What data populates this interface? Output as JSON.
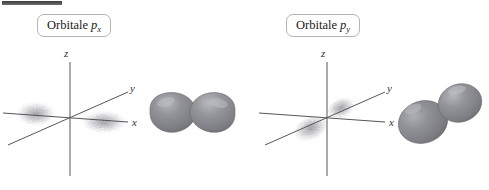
{
  "figure": {
    "type": "atomic-orbital-diagram",
    "background_color": "#ffffff",
    "top_rule_color": "#4a4a4a",
    "axis_color": "#55565a",
    "lobe_color": "#82838a",
    "lobe_highlight_color": "#b9bac0",
    "cloud_color": "#9a9aa0"
  },
  "panels": [
    {
      "id": "px",
      "label": {
        "prefix": "Orbitale ",
        "symbol": "p",
        "subscript": "x"
      },
      "axes": {
        "z": "z",
        "y": "y",
        "x": "x"
      },
      "cloud_axis": "x",
      "lobe_orientation": "horizontal"
    },
    {
      "id": "py",
      "label": {
        "prefix": "Orbitale ",
        "symbol": "p",
        "subscript": "y"
      },
      "axes": {
        "z": "z",
        "y": "y",
        "x": "x"
      },
      "cloud_axis": "y",
      "lobe_orientation": "diagonal"
    }
  ]
}
